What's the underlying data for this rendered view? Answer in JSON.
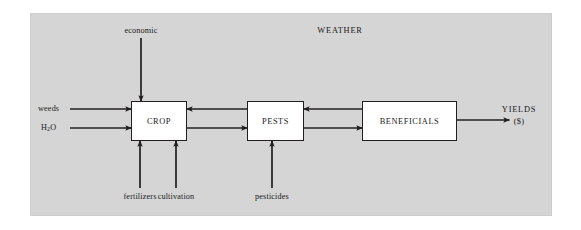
{
  "figure": {
    "type": "flow-diagram",
    "title_visible": false,
    "panel_background_color": "#d5d5d5",
    "page_background_color": "#ffffff",
    "line_color": "#231f20",
    "node_fill_color": "#ffffff"
  },
  "nodes": [
    {
      "id": "crop",
      "label": "CROP"
    },
    {
      "id": "pests",
      "label": "PESTS"
    },
    {
      "id": "beneficials",
      "label": "BENEFICIALS"
    }
  ],
  "labels": {
    "weather": "WEATHER",
    "economic": "economic",
    "weeds": "weeds",
    "water": "H",
    "water_sub": "2",
    "water_tail": "O",
    "fertilizers": "fertilizers",
    "cultivation": "cultivation",
    "pesticides": "pesticides",
    "yields": "YIELDS",
    "yields_unit": "($)"
  },
  "flows": [
    {
      "id": "economic-to-crop",
      "from": "economic",
      "to": "crop",
      "direction": "down"
    },
    {
      "id": "weeds-to-crop",
      "from": "weeds",
      "to": "crop",
      "direction": "right"
    },
    {
      "id": "water-to-crop",
      "from": "H2O",
      "to": "crop",
      "direction": "right"
    },
    {
      "id": "fertilizers-to-crop",
      "from": "fertilizers",
      "to": "crop",
      "direction": "up"
    },
    {
      "id": "cultivation-to-crop",
      "from": "cultivation",
      "to": "crop",
      "direction": "up"
    },
    {
      "id": "pests-to-crop",
      "from": "pests",
      "to": "crop",
      "direction": "left"
    },
    {
      "id": "crop-to-pests",
      "from": "crop",
      "to": "pests",
      "direction": "right"
    },
    {
      "id": "pesticides-to-pests",
      "from": "pesticides",
      "to": "pests",
      "direction": "up"
    },
    {
      "id": "beneficials-to-pests",
      "from": "beneficials",
      "to": "pests",
      "direction": "left"
    },
    {
      "id": "pests-to-beneficials",
      "from": "pests",
      "to": "beneficials",
      "direction": "right"
    },
    {
      "id": "beneficials-to-yields",
      "from": "beneficials",
      "to": "yields",
      "direction": "right"
    }
  ]
}
